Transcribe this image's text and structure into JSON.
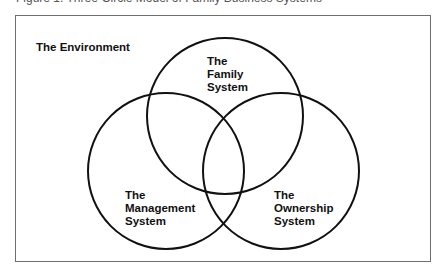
{
  "caption_cropped": "Figure 1. Three-Circle Model of Family Business Systems",
  "diagram": {
    "environment_label": "The Environment",
    "circles": [
      {
        "id": "family",
        "label": "The\nFamily\nSystem",
        "cx": 225,
        "cy": 116,
        "r": 78
      },
      {
        "id": "management",
        "label": "The\nManagement\nSystem",
        "cx": 166,
        "cy": 171,
        "r": 78
      },
      {
        "id": "ownership",
        "label": "The\nOwnership\nSystem",
        "cx": 281,
        "cy": 171,
        "r": 78
      }
    ],
    "stroke_color": "#111111",
    "frame_color": "#6e6e6e"
  }
}
